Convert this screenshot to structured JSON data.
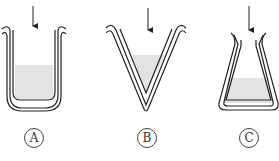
{
  "figure": {
    "containers": [
      {
        "label": "A",
        "shape": "U-shaped beaker"
      },
      {
        "label": "B",
        "shape": "V-shaped conical vessel"
      },
      {
        "label": "C",
        "shape": "Erlenmeyer flask"
      }
    ],
    "colors": {
      "stroke": "#222222",
      "liquid": "#e3e3e3"
    }
  }
}
